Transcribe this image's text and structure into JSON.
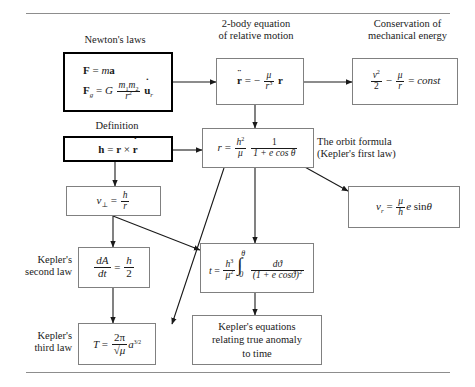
{
  "figure": {
    "type": "flowchart",
    "rules": [
      "top-rule",
      "bottom-rule"
    ]
  },
  "captions": {
    "newtons_laws": "Newton's laws",
    "two_body": "2-body equation\nof relative motion",
    "two_body_line1": "2-body equation",
    "two_body_line2": "of relative motion",
    "energy_line1": "Conservation of",
    "energy_line2": "mechanical energy",
    "definition": "Definition",
    "orbit_line1": "The orbit formula",
    "orbit_line2": "(Kepler's first law)",
    "kepler_second_line1": "Kepler's",
    "kepler_second_line2": "second law",
    "kepler_third_line1": "Kepler's",
    "kepler_third_line2": "third law"
  },
  "boxes": {
    "newtons_laws": {
      "id": "newtons-laws-box",
      "style": "heavy",
      "eq1_plain": "F = ma",
      "eq2_plain": "F_g = G (m1 m2 / r^2) u_r",
      "parts": {
        "F": "F",
        "equals": "=",
        "m": "m",
        "a": "a",
        "Fg": "F",
        "g": "g",
        "G": "G",
        "m1": "m",
        "one": "1",
        "m2": "m",
        "two": "2",
        "r": "r",
        "exp2": "2",
        "u": "u",
        "sub_r": "r"
      }
    },
    "two_body": {
      "id": "two-body-box",
      "eq_plain": "r̈ = − (μ / r^3) r",
      "parts": {
        "rddot": "r",
        "equals": "=",
        "minus": "−",
        "mu": "μ",
        "r": "r",
        "exp3": "3",
        "rvec": "r"
      }
    },
    "energy": {
      "id": "energy-box",
      "eq_plain": "v^2/2 − μ/r = const",
      "parts": {
        "v": "v",
        "exp2": "2",
        "two": "2",
        "minus": "−",
        "mu": "μ",
        "r": "r",
        "equals": "=",
        "const": "const"
      }
    },
    "definition": {
      "id": "angular-momentum-box",
      "style": "heavy",
      "eq_plain": "h = r × ṙ",
      "parts": {
        "h": "h",
        "equals": "=",
        "r": "r",
        "times": "×",
        "rdot": "r"
      }
    },
    "orbit_formula": {
      "id": "orbit-formula-box",
      "eq_plain": "r = (h^2/μ) · 1/(1 + e cos θ)",
      "parts": {
        "r": "r",
        "equals": "=",
        "h": "h",
        "exp2": "2",
        "mu": "μ",
        "one": "1",
        "denom": "1 + e cos θ"
      }
    },
    "v_perp": {
      "id": "v-perpendicular-box",
      "eq_plain": "v⊥ = h / r",
      "parts": {
        "v": "v",
        "perp": "⊥",
        "equals": "=",
        "h": "h",
        "r": "r"
      }
    },
    "v_radial": {
      "id": "v-radial-box",
      "eq_plain": "v_r = (μ/h) e sin θ",
      "parts": {
        "v": "v",
        "sub_r": "r",
        "equals": "=",
        "mu": "μ",
        "h": "h",
        "e": "e",
        "sin": "sin",
        "theta": "θ"
      }
    },
    "kepler_second": {
      "id": "kepler-second-law-box",
      "eq_plain": "dA/dt = h/2",
      "parts": {
        "dA": "dA",
        "dt": "dt",
        "equals": "=",
        "h": "h",
        "two": "2"
      }
    },
    "kepler_third": {
      "id": "kepler-third-law-box",
      "eq_plain": "T = (2π/√μ) a^(3/2)",
      "parts": {
        "T": "T",
        "equals": "=",
        "twopi": "2π",
        "sqrtmu": "√μ",
        "a": "a",
        "exp": "3/2"
      }
    },
    "time_integral": {
      "id": "time-integral-box",
      "eq_plain": "t = (h^3/μ^2) ∫_0^θ dϑ / (1 + e cos ϑ)^2",
      "parts": {
        "t": "t",
        "equals": "=",
        "h": "h",
        "exp3": "3",
        "mu": "μ",
        "exp2": "2",
        "upper": "θ",
        "lower": "0",
        "dvartheta": "dϑ",
        "denom": "(1 + e cosϑ)",
        "denomexp": "2"
      }
    },
    "kepler_equations": {
      "id": "kepler-equations-box",
      "line1": "Kepler's equations",
      "line2": "relating true anomaly",
      "line3": "to time"
    }
  },
  "colors": {
    "page_background": "#ffffff",
    "text": "#1a1a1a",
    "box_border_light": "#808080",
    "box_border_heavy": "#000000",
    "rule": "#8d8d8d",
    "arrow": "#1a1a1a"
  },
  "connections": [
    {
      "from": "newtons_laws",
      "to": "two_body"
    },
    {
      "from": "two_body",
      "to": "energy"
    },
    {
      "from": "two_body",
      "to": "orbit_formula"
    },
    {
      "from": "definition",
      "to": "orbit_formula"
    },
    {
      "from": "definition",
      "to": "v_perp"
    },
    {
      "from": "orbit_formula",
      "to": "v_radial"
    },
    {
      "from": "orbit_formula",
      "to": "time_integral"
    },
    {
      "from": "orbit_formula",
      "to": "kepler_third"
    },
    {
      "from": "v_perp",
      "to": "kepler_second"
    },
    {
      "from": "v_perp",
      "to": "time_integral"
    },
    {
      "from": "kepler_second",
      "to": "kepler_third"
    },
    {
      "from": "time_integral",
      "to": "kepler_equations"
    }
  ]
}
